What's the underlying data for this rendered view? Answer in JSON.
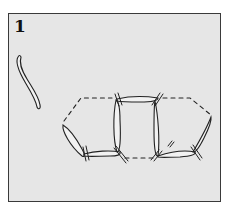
{
  "diagram": {
    "step_number": "1",
    "colors": {
      "background": "#e6e6e6",
      "frame_border": "#3a3a3a",
      "stroke": "#222222"
    },
    "elements": [
      {
        "name": "single-loop-strand",
        "description": "single elongated S-shaped loop at left"
      },
      {
        "name": "loop-chain",
        "description": "chain of six elongated loops forming a hexagonal/pretzel arrangement with crossing tick marks and dashed connecting lines"
      }
    ]
  }
}
